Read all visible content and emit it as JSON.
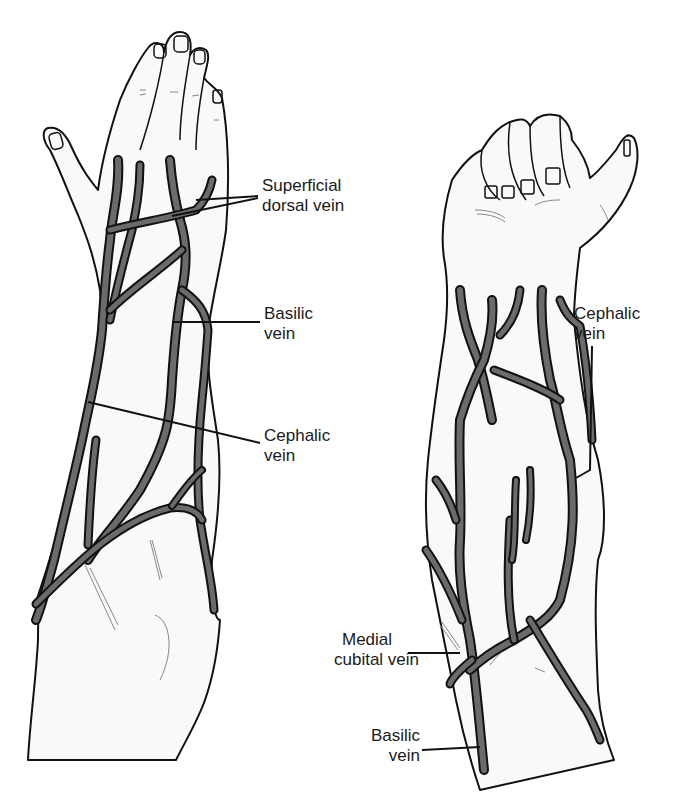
{
  "figure": {
    "colors": {
      "vein_fill": "#6b6b6b",
      "outline": "#111111",
      "skin": "#f9f9f9",
      "background": "#ffffff"
    },
    "left_arm": {
      "view": "dorsal",
      "labels": [
        {
          "id": "superficial-dorsal-vein",
          "lines": [
            "Superficial",
            "dorsal vein"
          ]
        },
        {
          "id": "basilic-vein",
          "lines": [
            "Basilic",
            "vein"
          ]
        },
        {
          "id": "cephalic-vein",
          "lines": [
            "Cephalic",
            "vein"
          ]
        }
      ]
    },
    "right_arm": {
      "view": "ventral",
      "labels": [
        {
          "id": "cephalic-vein",
          "lines": [
            "Cephalic",
            "vein"
          ]
        },
        {
          "id": "medial-cubital-vein",
          "lines": [
            "Medial",
            "cubital vein"
          ]
        },
        {
          "id": "basilic-vein",
          "lines": [
            "Basilic",
            "vein"
          ]
        }
      ]
    }
  }
}
